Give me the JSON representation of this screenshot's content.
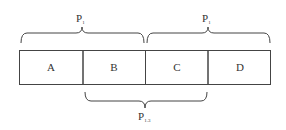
{
  "diagram": {
    "cells": [
      {
        "label": "A"
      },
      {
        "label": "B"
      },
      {
        "label": "C"
      },
      {
        "label": "D"
      }
    ],
    "braces": [
      {
        "position": "top",
        "span": [
          "A",
          "B"
        ],
        "label": "P",
        "subscript": "1"
      },
      {
        "position": "top",
        "span": [
          "C",
          "D"
        ],
        "label": "P",
        "subscript": "1"
      },
      {
        "position": "bottom",
        "span": [
          "B",
          "C"
        ],
        "label": "P",
        "subscript": "1.3"
      }
    ],
    "colors": {
      "stroke": "#444444",
      "text": "#333333",
      "background": "#ffffff"
    }
  }
}
